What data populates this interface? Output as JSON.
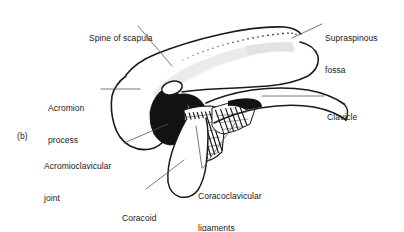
{
  "figure": {
    "panel_label": "(b)",
    "background_color": "#ffffff",
    "ink_color": "#1a1a1a",
    "shading_color": "#e8e8e8",
    "solid_fill_color": "#101010",
    "labels": [
      {
        "id": "spine-of-scapula",
        "text": "Spine of scapula",
        "lines": [
          "Spine of scapula"
        ]
      },
      {
        "id": "supraspinous-fossa",
        "text": "Supraspinous fossa",
        "lines": [
          "Supraspinous",
          "fossa"
        ]
      },
      {
        "id": "acromion-process",
        "text": "Acromion process",
        "lines": [
          "Acromion",
          "process"
        ]
      },
      {
        "id": "clavicle",
        "text": "Clavicle",
        "lines": [
          "Clavicle"
        ]
      },
      {
        "id": "acromioclavicular-joint",
        "text": "Acromioclavicular joint",
        "lines": [
          "Acromioclavicular",
          "joint"
        ]
      },
      {
        "id": "coracoclavicular-ligaments",
        "text": "Coracoclavicular ligaments",
        "lines": [
          "Coracoclavicular",
          "ligaments"
        ]
      },
      {
        "id": "coracoid-process",
        "text": "Coracoid process",
        "lines": [
          "Coracoid",
          "process"
        ]
      }
    ],
    "label_text": {
      "spine_of_scapula_l1": "Spine of scapula",
      "supraspinous_fossa_l1": "Supraspinous",
      "supraspinous_fossa_l2": "fossa",
      "acromion_process_l1": "Acromion",
      "acromion_process_l2": "process",
      "clavicle_l1": "Clavicle",
      "panel_b": "(b)",
      "acromioclavicular_joint_l1": "Acromioclavicular",
      "acromioclavicular_joint_l2": "joint",
      "coracoclavicular_ligaments_l1": "Coracoclavicular",
      "coracoclavicular_ligaments_l2": "ligaments",
      "coracoid_process_l1": "Coracoid",
      "coracoid_process_l2": "process"
    }
  }
}
